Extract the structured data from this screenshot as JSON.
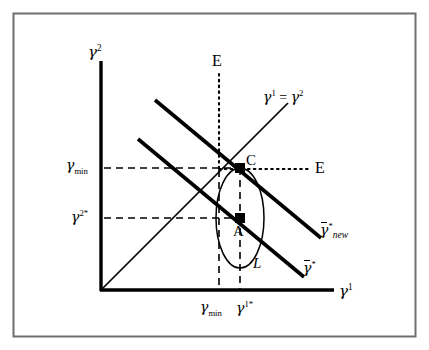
{
  "figure": {
    "type": "economics-diagram",
    "border_color": "#6b6b6b",
    "line_color": "#000000",
    "background": "#ffffff"
  },
  "axes": {
    "y_axis_label": "γ²",
    "x_axis_label": "γ¹",
    "origin_label": ""
  },
  "y_ticks": [
    {
      "id": "gamma-min",
      "label_main": "γ",
      "label_sub": "min",
      "value_y": 168
    },
    {
      "id": "gamma-2-star",
      "label_main": "γ",
      "label_sup": "2*",
      "value_y": 218
    }
  ],
  "x_ticks": [
    {
      "id": "gamma-min",
      "label_main": "γ",
      "label_sub": "min",
      "value_x": 219
    },
    {
      "id": "gamma-1-star",
      "label_main": "γ",
      "label_sup": "1*",
      "value_x": 240
    }
  ],
  "curves": [
    {
      "id": "gamma-bar-star-new",
      "label": "γ̄*new",
      "label_base": "γ",
      "label_sup": "*",
      "label_sub": "new",
      "kind": "budget-line-new"
    },
    {
      "id": "gamma-bar-star",
      "label": "γ̄*",
      "label_base": "γ",
      "label_sup": "*",
      "kind": "budget-line"
    },
    {
      "id": "forty-five-line",
      "label": "γ¹ = γ²",
      "kind": "45-degree-line"
    },
    {
      "id": "indifference-ellipse",
      "label": "L",
      "kind": "iso-curve"
    }
  ],
  "points": [
    {
      "id": "point-C",
      "label": "C",
      "x": 240,
      "y": 168
    },
    {
      "id": "point-A",
      "label": "A",
      "x": 240,
      "y": 218
    }
  ],
  "equilibrium_markers": [
    {
      "id": "E-vertical",
      "label": "E",
      "orientation": "vertical-dotted"
    },
    {
      "id": "E-horizontal",
      "label": "E",
      "orientation": "horizontal-dotted"
    }
  ],
  "labels": {
    "E_top": "E",
    "E_right": "E",
    "point_C": "C",
    "point_A": "A",
    "curve_L": "L",
    "line45": "γ¹ = γ²",
    "gamma_char": "γ",
    "equals": " = ",
    "star": "*",
    "new": "new",
    "min": "min",
    "sup1": "1",
    "sup2": "2",
    "sup1star": "1*",
    "sup2star": "2*"
  }
}
